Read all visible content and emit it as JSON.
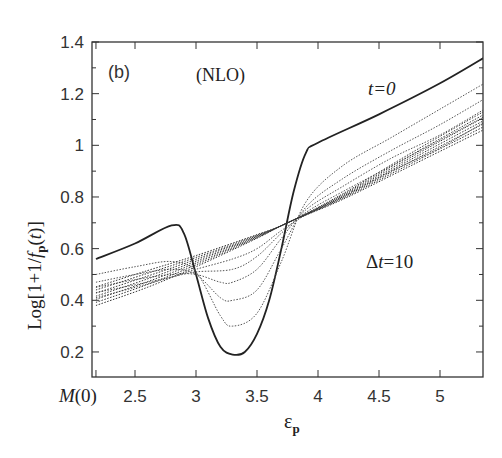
{
  "chart_data": {
    "type": "line",
    "panel_label": "(b)",
    "title": "(NLO)",
    "xlabel": "ε_p",
    "ylabel": "Log[1+1/f_p(t)]",
    "xlim": [
      2.15,
      5.4
    ],
    "ylim": [
      0.1,
      1.4
    ],
    "xticks": [
      {
        "value": 2.18,
        "label": "M(0)"
      },
      {
        "value": 2.5,
        "label": "2.5"
      },
      {
        "value": 3,
        "label": "3"
      },
      {
        "value": 3.5,
        "label": "3.5"
      },
      {
        "value": 4,
        "label": "4"
      },
      {
        "value": 4.5,
        "label": "4.5"
      },
      {
        "value": 5,
        "label": "5"
      }
    ],
    "yticks": [
      "0.2",
      "0.4",
      "0.6",
      "0.8",
      "1",
      "1.2",
      "1.4"
    ],
    "annotations": [
      {
        "text": "t=0",
        "x": 4.95,
        "y": 1.22
      },
      {
        "text": "Δt=10",
        "x": 4.5,
        "y": 0.55
      }
    ],
    "series": [
      {
        "name": "t=0",
        "style": "solid",
        "x": [
          2.18,
          2.5,
          2.8,
          2.9,
          3.0,
          3.1,
          3.2,
          3.3,
          3.4,
          3.5,
          3.6,
          3.7,
          3.8,
          3.9,
          4.0,
          4.5,
          5.0,
          5.4
        ],
        "y": [
          0.56,
          0.62,
          0.69,
          0.66,
          0.5,
          0.33,
          0.22,
          0.19,
          0.2,
          0.27,
          0.4,
          0.6,
          0.82,
          0.97,
          1.01,
          1.12,
          1.24,
          1.35
        ]
      },
      {
        "name": "t=1",
        "style": "dotted",
        "x": [
          2.18,
          2.5,
          2.8,
          3.0,
          3.2,
          3.3,
          3.5,
          3.7,
          3.9,
          4.2,
          4.6,
          5.0,
          5.4
        ],
        "y": [
          0.5,
          0.53,
          0.55,
          0.51,
          0.34,
          0.3,
          0.35,
          0.55,
          0.78,
          0.92,
          1.03,
          1.14,
          1.25
        ]
      },
      {
        "name": "t=2",
        "style": "dotted",
        "x": [
          2.18,
          2.5,
          2.8,
          3.0,
          3.2,
          3.3,
          3.5,
          3.7,
          3.9,
          4.2,
          4.6,
          5.0,
          5.4
        ],
        "y": [
          0.47,
          0.5,
          0.52,
          0.5,
          0.41,
          0.4,
          0.44,
          0.6,
          0.76,
          0.87,
          0.98,
          1.08,
          1.19
        ]
      },
      {
        "name": "t=3",
        "style": "dotted",
        "x": [
          2.18,
          2.5,
          2.8,
          3.0,
          3.2,
          3.3,
          3.5,
          3.7,
          3.9,
          4.2,
          4.6,
          5.0,
          5.4
        ],
        "y": [
          0.45,
          0.48,
          0.5,
          0.5,
          0.47,
          0.47,
          0.52,
          0.64,
          0.75,
          0.84,
          0.95,
          1.04,
          1.15
        ]
      },
      {
        "name": "t=4",
        "style": "dotted",
        "x": [
          2.18,
          2.5,
          2.8,
          3.0,
          3.3,
          3.5,
          3.7,
          3.9,
          4.2,
          4.6,
          5.0,
          5.4
        ],
        "y": [
          0.43,
          0.46,
          0.49,
          0.51,
          0.52,
          0.57,
          0.66,
          0.74,
          0.82,
          0.92,
          1.02,
          1.12
        ]
      },
      {
        "name": "t=5",
        "style": "dotted",
        "x": [
          2.18,
          2.5,
          2.8,
          3.0,
          3.3,
          3.5,
          3.7,
          3.9,
          4.2,
          4.6,
          5.0,
          5.4
        ],
        "y": [
          0.41,
          0.45,
          0.49,
          0.52,
          0.56,
          0.6,
          0.67,
          0.73,
          0.8,
          0.9,
          0.99,
          1.1
        ]
      },
      {
        "name": "t=6..10",
        "style": "dotted-bundle",
        "x": [
          2.18,
          5.4
        ],
        "y": [
          0.38,
          1.07
        ]
      }
    ]
  }
}
